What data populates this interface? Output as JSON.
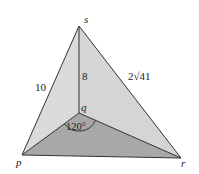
{
  "diagram": {
    "type": "tetrahedron",
    "vertices": {
      "s": {
        "label": "s"
      },
      "p": {
        "label": "p"
      },
      "q": {
        "label": "q"
      },
      "r": {
        "label": "r"
      }
    },
    "edge_labels": {
      "ps": "10",
      "qs": "8",
      "rs": "2√41"
    },
    "angle_label": "120°",
    "colors": {
      "front_face": "#d9d9d9",
      "right_face": "#d3d3d3",
      "base_face": "#a9a9a9",
      "edge": "#333333"
    }
  }
}
